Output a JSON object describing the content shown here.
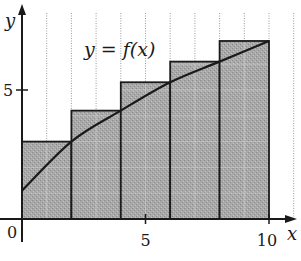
{
  "chart_data": {
    "type": "bar",
    "subtype": "right-endpoint Riemann sum with curve",
    "title": "",
    "xlabel": "x",
    "ylabel": "y",
    "curve_label": "y = f(x)",
    "xlim": [
      0,
      11
    ],
    "ylim": [
      0,
      8
    ],
    "x_ticks": [
      0,
      5,
      10
    ],
    "y_ticks": [
      5
    ],
    "x_tick_labels": [
      "0",
      "5",
      "10"
    ],
    "y_tick_labels": [
      "5"
    ],
    "grid": "dotted vertical lines at each integer x",
    "categories": [
      "[0,2]",
      "[2,4]",
      "[4,6]",
      "[6,8]",
      "[8,10]"
    ],
    "rect_intervals": [
      [
        0,
        2
      ],
      [
        2,
        4
      ],
      [
        4,
        6
      ],
      [
        6,
        8
      ],
      [
        8,
        10
      ]
    ],
    "values": [
      3.0,
      4.2,
      5.3,
      6.1,
      6.9
    ],
    "curve": {
      "x": [
        0,
        2,
        4,
        6,
        8,
        10
      ],
      "y": [
        1.1,
        3.0,
        4.2,
        5.3,
        6.1,
        6.9
      ]
    }
  },
  "colors": {
    "rect_fill": "#a8a8a8",
    "stroke": "#1a1a1a",
    "grid": "#9a9a9a"
  }
}
